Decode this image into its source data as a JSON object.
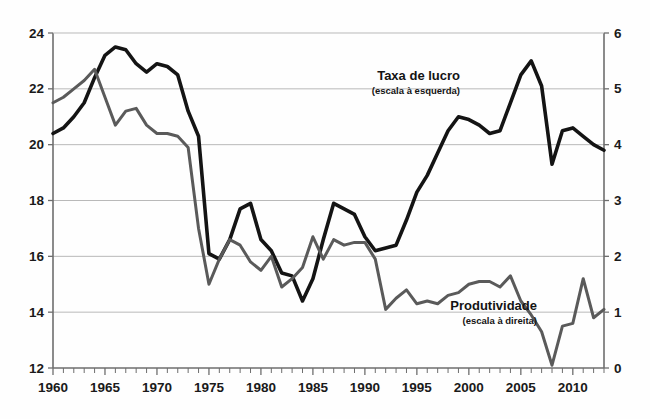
{
  "chart_data": {
    "type": "line",
    "title": "",
    "xlabel": "",
    "grid": true,
    "legend_position": "inline-annotations",
    "x": [
      1960,
      1961,
      1962,
      1963,
      1964,
      1965,
      1966,
      1967,
      1968,
      1969,
      1970,
      1971,
      1972,
      1973,
      1974,
      1975,
      1976,
      1977,
      1978,
      1979,
      1980,
      1981,
      1982,
      1983,
      1984,
      1985,
      1986,
      1987,
      1988,
      1989,
      1990,
      1991,
      1992,
      1993,
      1994,
      1995,
      1996,
      1997,
      1998,
      1999,
      2000,
      2001,
      2002,
      2003,
      2004,
      2005,
      2006,
      2007,
      2008,
      2009,
      2010,
      2011,
      2012,
      2013
    ],
    "xlim": [
      1960,
      2013
    ],
    "xticklabels": [
      "1960",
      "1965",
      "1970",
      "1975",
      "1980",
      "1985",
      "1990",
      "1995",
      "2000",
      "2005",
      "2010"
    ],
    "xtick_step_major": 5,
    "xtick_step_minor": 1,
    "axes": [
      {
        "id": "left",
        "name": "Taxa de lucro",
        "ylim": [
          12,
          24
        ],
        "yticklabels": [
          "12",
          "14",
          "16",
          "18",
          "20",
          "22",
          "24"
        ],
        "ytick_step": 2,
        "color": "#141414"
      },
      {
        "id": "right",
        "name": "Produtividade",
        "ylim": [
          0,
          6
        ],
        "yticklabels": [
          "0",
          "1",
          "2",
          "3",
          "4",
          "5",
          "6"
        ],
        "ytick_step": 1,
        "color": "#5a5a5a"
      }
    ],
    "series": [
      {
        "name": "Taxa de lucro",
        "axis": "left",
        "color": "#141414",
        "width": 3.6,
        "annotation_title": "Taxa de lucro",
        "annotation_sub": "(escala à esquerda)",
        "values": [
          20.4,
          20.6,
          21.0,
          21.5,
          22.4,
          23.2,
          23.5,
          23.4,
          22.9,
          22.6,
          22.9,
          22.8,
          22.5,
          21.2,
          20.3,
          16.1,
          15.9,
          16.6,
          17.7,
          17.9,
          16.6,
          16.2,
          15.4,
          15.3,
          14.4,
          15.2,
          16.6,
          17.9,
          17.7,
          17.5,
          16.7,
          16.2,
          16.3,
          16.4,
          17.3,
          18.3,
          18.9,
          19.7,
          20.5,
          21.0,
          20.9,
          20.7,
          20.4,
          20.5,
          21.5,
          22.5,
          23.0,
          22.1,
          19.3,
          20.5,
          20.6,
          20.3,
          20.0,
          19.8
        ]
      },
      {
        "name": "Produtividade",
        "axis": "right",
        "color": "#5a5a5a",
        "width": 3.0,
        "annotation_title": "Produtividade",
        "annotation_sub": "(escala à direita)",
        "values": [
          4.75,
          4.85,
          5.0,
          5.15,
          5.35,
          4.85,
          4.35,
          4.6,
          4.65,
          4.35,
          4.2,
          4.2,
          4.15,
          3.95,
          2.5,
          1.5,
          1.95,
          2.3,
          2.2,
          1.9,
          1.75,
          2.0,
          1.45,
          1.6,
          1.8,
          2.35,
          1.95,
          2.3,
          2.2,
          2.25,
          2.25,
          1.95,
          1.05,
          1.25,
          1.4,
          1.15,
          1.2,
          1.15,
          1.3,
          1.35,
          1.5,
          1.55,
          1.55,
          1.45,
          1.65,
          1.2,
          0.95,
          0.65,
          0.05,
          0.75,
          0.8,
          1.6,
          0.9,
          1.05
        ]
      }
    ]
  },
  "annotations": {
    "profit": {
      "title": "Taxa de lucro",
      "sub": "(escala à esquerda)"
    },
    "productivity": {
      "title": "Produtividade",
      "sub": "(escala à direita)"
    }
  }
}
